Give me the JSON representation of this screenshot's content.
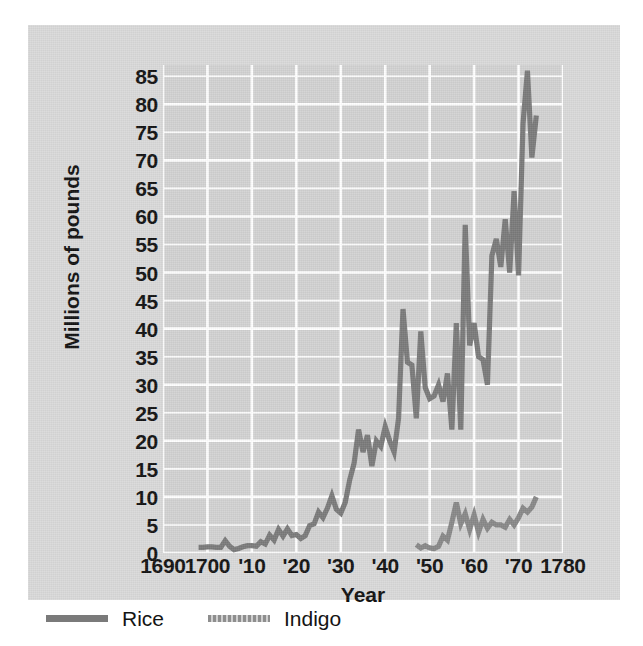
{
  "chart_data": {
    "type": "line",
    "title": "",
    "subtitle": "",
    "xlabel": "Year",
    "ylabel": "Millions of pounds",
    "xlim": [
      1690,
      1780
    ],
    "ylim": [
      0,
      87
    ],
    "yticks": [
      0,
      5,
      10,
      15,
      20,
      25,
      30,
      35,
      40,
      45,
      50,
      55,
      60,
      65,
      70,
      75,
      80,
      85
    ],
    "ytick_labels": [
      "0",
      "5",
      "10",
      "15",
      "20",
      "25",
      "30",
      "35",
      "40",
      "45",
      "50",
      "55",
      "60",
      "65",
      "70",
      "75",
      "80",
      "85"
    ],
    "xticks": [
      1690,
      1700,
      1710,
      1720,
      1730,
      1740,
      1750,
      1760,
      1770,
      1780
    ],
    "xtick_labels": [
      "1690",
      "1700",
      "'10",
      "'20",
      "'30",
      "'40",
      "'50",
      "'60",
      "'70",
      "1780"
    ],
    "grid": true,
    "grid_color": "#ffffff",
    "plot_background": "#d2d2d2",
    "figure_background": "#d9d9d9",
    "legend_position": "below-left",
    "series": [
      {
        "name": "Rice",
        "color": "#7a7a7a",
        "x": [
          1698,
          1699,
          1700,
          1701,
          1702,
          1703,
          1704,
          1705,
          1706,
          1707,
          1708,
          1709,
          1710,
          1711,
          1712,
          1713,
          1714,
          1715,
          1716,
          1717,
          1718,
          1719,
          1720,
          1721,
          1722,
          1723,
          1724,
          1725,
          1726,
          1727,
          1728,
          1729,
          1730,
          1731,
          1732,
          1733,
          1734,
          1735,
          1736,
          1737,
          1738,
          1739,
          1740,
          1741,
          1742,
          1743,
          1744,
          1745,
          1746,
          1747,
          1748,
          1749,
          1750,
          1751,
          1752,
          1753,
          1754,
          1755,
          1756,
          1757,
          1758,
          1759,
          1760,
          1761,
          1762,
          1763,
          1764,
          1765,
          1766,
          1767,
          1768,
          1769,
          1770,
          1771,
          1772,
          1773,
          1774
        ],
        "values": [
          1.0,
          1.0,
          1.1,
          1.1,
          1.0,
          1.0,
          2.2,
          1.2,
          0.6,
          0.8,
          1.1,
          1.3,
          1.3,
          1.2,
          2.0,
          1.6,
          3.2,
          2.3,
          4.2,
          3.0,
          4.3,
          3.1,
          3.3,
          2.6,
          3.1,
          4.9,
          5.2,
          7.3,
          6.3,
          8.0,
          10.2,
          7.8,
          7.1,
          9.0,
          13.0,
          16.0,
          22.0,
          18.0,
          21.0,
          15.5,
          20.0,
          19.0,
          22.5,
          20.0,
          18.0,
          24.0,
          43.5,
          34.0,
          33.5,
          24.0,
          39.5,
          29.5,
          27.5,
          28.0,
          30.0,
          27.0,
          32.0,
          22.0,
          41.0,
          22.0,
          58.5,
          37.0,
          41.0,
          35.0,
          34.5,
          30.0,
          53.0,
          56.0,
          51.0,
          59.5,
          50.0,
          64.5,
          49.5,
          76.5,
          86.0,
          70.5,
          78.0
        ]
      },
      {
        "name": "Indigo",
        "color": "#888888",
        "x": [
          1747,
          1748,
          1749,
          1750,
          1751,
          1752,
          1753,
          1754,
          1755,
          1756,
          1757,
          1758,
          1759,
          1760,
          1761,
          1762,
          1763,
          1764,
          1765,
          1766,
          1767,
          1768,
          1769,
          1770,
          1771,
          1772,
          1773,
          1774
        ],
        "values": [
          1.5,
          0.9,
          1.3,
          0.9,
          0.8,
          1.2,
          3.0,
          2.3,
          5.5,
          9.0,
          5.2,
          7.0,
          4.2,
          6.8,
          3.7,
          6.0,
          4.4,
          5.5,
          5.0,
          5.0,
          4.6,
          6.0,
          5.0,
          6.3,
          8.0,
          7.3,
          8.2,
          10.0
        ]
      }
    ]
  },
  "axis": {
    "ylabel": "Millions of pounds",
    "xlabel": "Year"
  },
  "legend": {
    "items": [
      {
        "label": "Rice",
        "color": "#7a7a7a",
        "swatch": "solid-line-swatch"
      },
      {
        "label": "Indigo",
        "color": "#8e8e8e",
        "swatch": "dotted-line-swatch"
      }
    ]
  }
}
